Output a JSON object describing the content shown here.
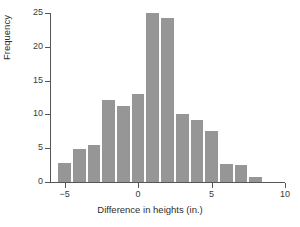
{
  "chart_data": {
    "type": "bar",
    "title": "",
    "subtitle": "",
    "xlabel": "Difference in heights (in.)",
    "ylabel": "Frequency",
    "xlim": [
      -6,
      10
    ],
    "ylim": [
      0,
      25
    ],
    "xticks": [
      -5,
      0,
      5,
      10
    ],
    "xtick_labels": [
      "−5",
      "0",
      "5",
      "10"
    ],
    "yticks": [
      0,
      5,
      10,
      15,
      20,
      25
    ],
    "ytick_labels": [
      "0",
      "5",
      "10",
      "15",
      "20",
      "25"
    ],
    "grid": false,
    "legend": null,
    "bin_width": 1,
    "bar_color": "#969696",
    "bar_edge_color": "#ffffff",
    "axis_color": "#555555",
    "bin_starts": [
      -5.5,
      -4.5,
      -3.5,
      -2.5,
      -1.5,
      -0.5,
      0.5,
      1.5,
      2.5,
      3.5,
      4.5,
      5.5,
      6.5,
      7.5
    ],
    "categories": [
      "-5.5 to -4.5",
      "-4.5 to -3.5",
      "-3.5 to -2.5",
      "-2.5 to -1.5",
      "-1.5 to -0.5",
      "-0.5 to 0.5",
      "0.5 to 1.5",
      "1.5 to 2.5",
      "2.5 to 3.5",
      "3.5 to 4.5",
      "4.5 to 5.5",
      "5.5 to 6.5",
      "6.5 to 7.5",
      "7.5 to 8.5"
    ],
    "values": [
      2.8,
      4.9,
      5.5,
      12.2,
      11.2,
      13.0,
      25.0,
      24.3,
      10.0,
      9.2,
      7.6,
      2.6,
      2.5,
      0.7
    ]
  }
}
